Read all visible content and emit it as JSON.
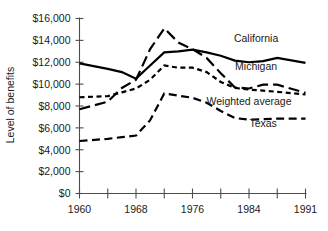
{
  "chart_data": {
    "type": "line",
    "title": "",
    "xlabel": "",
    "ylabel": "Level of benefits",
    "xlim": [
      1960,
      1991
    ],
    "ylim": [
      0,
      16000
    ],
    "grid": false,
    "legend_position": "inline-right",
    "x_tick_labels": [
      "1960",
      "",
      "1968",
      "",
      "1976",
      "",
      "1984",
      "",
      "1991"
    ],
    "x_tick_years": [
      1960,
      1964,
      1968,
      1972,
      1976,
      1980,
      1984,
      1988,
      1991
    ],
    "y_tick_labels": [
      "$16,000",
      "$14,000",
      "$12,000",
      "$10,000",
      "$8,000",
      "$6,000",
      "$4,000",
      "$2,000",
      "$0"
    ],
    "y_tick_values": [
      16000,
      14000,
      12000,
      10000,
      8000,
      6000,
      4000,
      2000,
      0
    ],
    "x": [
      1960,
      1964,
      1966,
      1968,
      1970,
      1972,
      1974,
      1976,
      1978,
      1980,
      1982,
      1984,
      1986,
      1988,
      1991
    ],
    "series": [
      {
        "name": "California",
        "style": "solid",
        "label": "California",
        "values": [
          11900,
          11400,
          11100,
          10500,
          11700,
          12900,
          13000,
          13150,
          12900,
          12600,
          12150,
          12000,
          12100,
          12400,
          11950
        ]
      },
      {
        "name": "Michigan",
        "style": "long-dash",
        "label": "Michigan",
        "values": [
          7700,
          8400,
          9650,
          10400,
          13200,
          15100,
          13800,
          13200,
          12400,
          11000,
          9700,
          9600,
          9950,
          9950,
          9200
        ]
      },
      {
        "name": "Weighted average",
        "style": "short-dash",
        "label": "Weighted average",
        "values": [
          8800,
          8900,
          9250,
          9600,
          10400,
          11700,
          11500,
          11500,
          11100,
          10200,
          9650,
          9500,
          9400,
          9300,
          9050
        ]
      },
      {
        "name": "Texas",
        "style": "medium-dash",
        "label": "Texas",
        "values": [
          4800,
          5000,
          5150,
          5300,
          6700,
          9150,
          8950,
          8750,
          8300,
          7550,
          6900,
          6750,
          6800,
          6850,
          6850
        ]
      }
    ],
    "annotations": [
      {
        "text": "California",
        "x": 1985,
        "y": 13850
      },
      {
        "text": "Michigan",
        "x": 1985,
        "y": 11250
      },
      {
        "text": "Weighted average",
        "x": 1984,
        "y": 8100
      },
      {
        "text": "Texas",
        "x": 1986,
        "y": 6100
      }
    ]
  }
}
